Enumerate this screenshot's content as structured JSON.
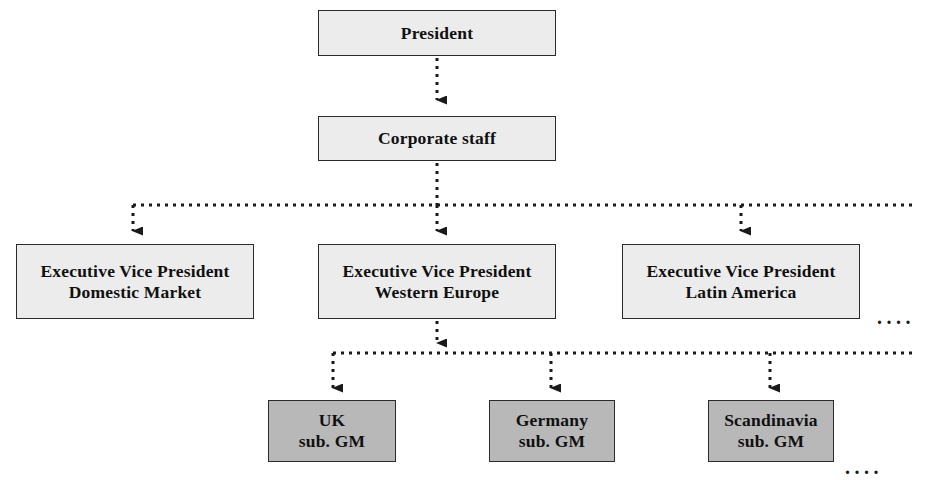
{
  "diagram": {
    "type": "org-chart",
    "colors": {
      "box_fill_upper": "#ececec",
      "box_fill_lower": "#b8b8b8",
      "box_border": "#2b2b2b",
      "connector": "#1a1a1a",
      "background": "#ffffff"
    },
    "nodes": [
      {
        "id": "president",
        "lines": [
          "President"
        ],
        "level": 0,
        "shade": "light",
        "x": 318,
        "y": 10,
        "w": 238,
        "h": 46
      },
      {
        "id": "corporate-staff",
        "lines": [
          "Corporate staff"
        ],
        "level": 1,
        "shade": "light",
        "x": 318,
        "y": 116,
        "w": 238,
        "h": 45
      },
      {
        "id": "evp-domestic-market",
        "lines": [
          "Executive Vice President",
          "Domestic Market"
        ],
        "level": 2,
        "shade": "light",
        "x": 16,
        "y": 244,
        "w": 238,
        "h": 75
      },
      {
        "id": "evp-western-europe",
        "lines": [
          "Executive Vice President",
          "Western Europe"
        ],
        "level": 2,
        "shade": "light",
        "x": 318,
        "y": 244,
        "w": 238,
        "h": 75
      },
      {
        "id": "evp-latin-america",
        "lines": [
          "Executive Vice President",
          "Latin America"
        ],
        "level": 2,
        "shade": "light",
        "x": 622,
        "y": 244,
        "w": 238,
        "h": 75
      },
      {
        "id": "uk-sub-gm",
        "lines": [
          "UK",
          "sub. GM"
        ],
        "level": 3,
        "shade": "dark",
        "x": 268,
        "y": 400,
        "w": 128,
        "h": 62
      },
      {
        "id": "germany-sub-gm",
        "lines": [
          "Germany",
          "sub. GM"
        ],
        "level": 3,
        "shade": "dark",
        "x": 489,
        "y": 400,
        "w": 126,
        "h": 62
      },
      {
        "id": "scandinavia-sub-gm",
        "lines": [
          "Scandinavia",
          "sub. GM"
        ],
        "level": 3,
        "shade": "dark",
        "x": 708,
        "y": 400,
        "w": 126,
        "h": 62
      }
    ],
    "ellipses": [
      {
        "id": "ellipsis-evp-row",
        "text": "....",
        "x": 877,
        "y": 306
      },
      {
        "id": "ellipsis-sub-row",
        "text": "....",
        "x": 845,
        "y": 456
      }
    ],
    "connectors": {
      "president_to_corporate": {
        "x": 437,
        "y1": 58,
        "y2": 114
      },
      "corporate_to_bus": {
        "x": 437,
        "y1": 163,
        "y2": 205
      },
      "bus_evp": {
        "y": 205,
        "x1": 133,
        "x2": 916
      },
      "bus_evp_drops": [
        {
          "x": 133,
          "y1": 205,
          "y2": 242
        },
        {
          "x": 437,
          "y1": 205,
          "y2": 242
        },
        {
          "x": 741,
          "y1": 205,
          "y2": 242
        }
      ],
      "western_europe_to_bus": {
        "x": 437,
        "y1": 321,
        "y2": 353
      },
      "bus_sub": {
        "y": 353,
        "x1": 333,
        "x2": 916
      },
      "bus_sub_drops": [
        {
          "x": 333,
          "y1": 353,
          "y2": 398
        },
        {
          "x": 551,
          "y1": 353,
          "y2": 398
        },
        {
          "x": 770,
          "y1": 353,
          "y2": 398
        }
      ]
    }
  }
}
